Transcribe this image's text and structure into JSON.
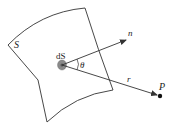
{
  "diagram": {
    "labels": {
      "surface": "S",
      "element": "dS",
      "normal": "n",
      "angle": "θ",
      "vector": "r",
      "point": "P"
    },
    "colors": {
      "stroke": "#333333",
      "element_fill": "#8a8a8a",
      "element_core": "#555555"
    }
  }
}
